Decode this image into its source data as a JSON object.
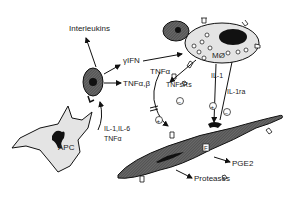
{
  "diagram": {
    "labels": {
      "interleukins": "Interleukins",
      "yifn": "γIFN",
      "tnf_ab": "TNFα,β",
      "tnfa": "TNFα",
      "tnfsrs": "TNFsRs",
      "il1": "IL-1",
      "il1ra": "IL-1ra",
      "mo": "MØ",
      "apc": "APC",
      "il1_il6": "IL-1,IL-6",
      "apc_tnfa": "TNFα",
      "fibroblast": "F",
      "pge2": "PGE2",
      "proteases": "Proteases",
      "plus": "+",
      "minus": "−"
    },
    "colors": {
      "stroke": "#111111",
      "cell_light": "#e4e4e4",
      "cell_dark": "#555555",
      "nucleus": "#111111"
    }
  }
}
